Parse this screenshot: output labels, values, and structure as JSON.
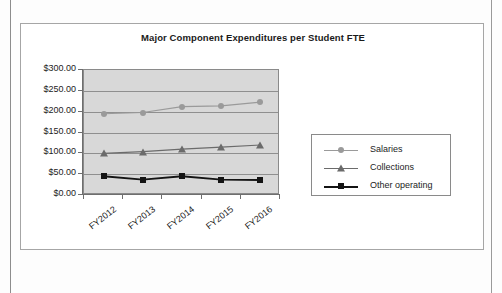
{
  "chart_data": {
    "type": "line",
    "title": "Major Component Expenditures per Student FTE",
    "xlabel": "",
    "ylabel": "",
    "categories": [
      "FY2012",
      "FY2013",
      "FY2014",
      "FY2015",
      "FY2016"
    ],
    "ylim": [
      0,
      300
    ],
    "ytick_labels": [
      "$300.00",
      "$250.00",
      "$200.00",
      "$150.00",
      "$100.00",
      "$50.00",
      "$0.00"
    ],
    "ytick_values": [
      300,
      250,
      200,
      150,
      100,
      50,
      0
    ],
    "grid": true,
    "legend_position": "right",
    "series": [
      {
        "name": "Salaries",
        "values": [
          195,
          198,
          212,
          214,
          223
        ],
        "color": "#9a9a9a",
        "marker": "circle"
      },
      {
        "name": "Collections",
        "values": [
          100,
          104,
          110,
          115,
          120
        ],
        "color": "#6b6b6b",
        "marker": "triangle"
      },
      {
        "name": "Other operating",
        "values": [
          45,
          37,
          45,
          37,
          36
        ],
        "color": "#141414",
        "marker": "square"
      }
    ]
  },
  "legend": {
    "items": [
      {
        "label": "Salaries"
      },
      {
        "label": "Collections"
      },
      {
        "label": "Other operating"
      }
    ]
  },
  "colors": {
    "plot_background": "#d8d8d8",
    "gridline": "#8f8f8f",
    "frame": "#a6a6a6",
    "axis": "#6e6e6e",
    "text": "#1c1c1c"
  }
}
